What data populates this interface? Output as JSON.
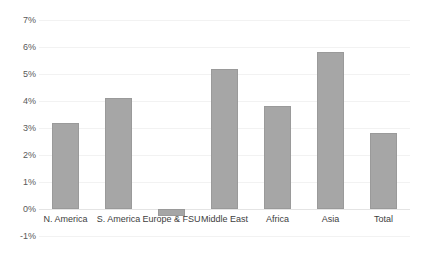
{
  "chart_data": {
    "type": "bar",
    "title": "",
    "xlabel": "",
    "ylabel": "",
    "categories": [
      "N. America",
      "S. America",
      "Europe & FSU",
      "Middle East",
      "Africa",
      "Asia",
      "Total"
    ],
    "values": [
      3.2,
      4.1,
      -0.25,
      5.2,
      3.8,
      5.8,
      2.8
    ],
    "ylim": [
      -1,
      7
    ],
    "ytick_labels": [
      "7%",
      "6%",
      "5%",
      "4%",
      "3%",
      "2%",
      "1%",
      "0%",
      "-1%"
    ],
    "ytick_values": [
      7,
      6,
      5,
      4,
      3,
      2,
      1,
      0,
      -1
    ],
    "grid": true,
    "legend": "none",
    "series_color": "#a6a6a6",
    "gridline_color": "#f2f2f2",
    "axis_text_color": "#595959"
  }
}
